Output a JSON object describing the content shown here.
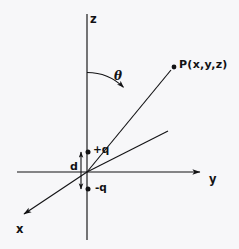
{
  "figure": {
    "background_color": "#f7f7f9",
    "ink_color": "#121214",
    "width": 239,
    "height": 249
  },
  "axes": [
    {
      "name": "z-axis",
      "label": "z",
      "label_x": 90,
      "label_y": 16,
      "orientation": "vertical-up"
    },
    {
      "name": "y-axis",
      "label": "y",
      "label_x": 209,
      "label_y": 172,
      "orientation": "horizontal-right"
    },
    {
      "name": "x-axis",
      "label": "x",
      "label_x": 18,
      "label_y": 226,
      "orientation": "diagonal-down-left"
    }
  ],
  "angle": {
    "label": "θ",
    "label_x": 114,
    "label_y": 72,
    "description": "polar angle from z-axis to radial ray"
  },
  "point": {
    "label": "P(x,y,z)",
    "label_x": 180,
    "label_y": 60,
    "dot_x": 174,
    "dot_y": 67
  },
  "charges": [
    {
      "name": "positive-charge",
      "label": "+q",
      "label_x": 95,
      "label_y": 144,
      "dot_x": 88,
      "dot_y": 152
    },
    {
      "name": "negative-charge",
      "label": "-q",
      "label_x": 97,
      "label_y": 182,
      "dot_x": 88,
      "dot_y": 189
    }
  ],
  "separation": {
    "label": "d",
    "label_x": 71,
    "label_y": 163,
    "arrow_x": 81,
    "arrow_top": 151,
    "arrow_bottom": 190
  },
  "geometry": {
    "origin": {
      "x": 87,
      "y": 172
    },
    "z_axis_line": {
      "x1": 87,
      "y1": 14,
      "x2": 87,
      "y2": 240
    },
    "y_axis_line": {
      "x1": 17,
      "y1": 172,
      "x2": 203,
      "y2": 172
    },
    "x_axis_ray": {
      "x1": 87,
      "y1": 172,
      "x2": 20,
      "y2": 217
    },
    "radial_ray": {
      "x1": 87,
      "y1": 172,
      "x2": 172,
      "y2": 69
    },
    "projection_ray": {
      "x1": 87,
      "y1": 172,
      "x2": 168,
      "y2": 131
    },
    "theta_arc": {
      "start_x": 87,
      "start_y": 72,
      "end_x": 134,
      "end_y": 101,
      "radius": 52
    }
  }
}
